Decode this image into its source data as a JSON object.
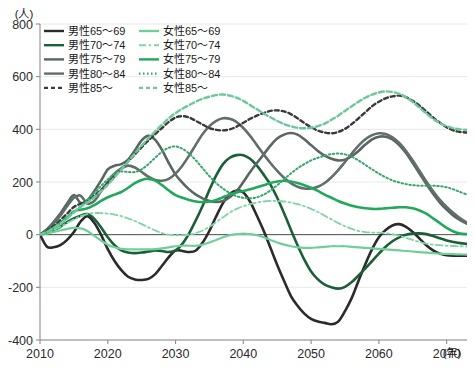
{
  "chart_data": {
    "type": "line",
    "title": "",
    "ylabel": "(人)",
    "xlabel": "(年)",
    "ylim": [
      -400,
      800
    ],
    "xlim": [
      2010,
      2073
    ],
    "yticks": [
      -400,
      -200,
      0,
      200,
      400,
      600,
      800
    ],
    "ytick_labels": [
      "-400",
      "-200",
      "0",
      "200",
      "400",
      "600",
      "800"
    ],
    "xticks": [
      2010,
      2020,
      2030,
      2040,
      2050,
      2060,
      2070
    ],
    "xtick_labels": [
      "2010",
      "2020",
      "2030",
      "2040",
      "2050",
      "2060",
      "2070"
    ],
    "grid": true,
    "legend_position": "top-left",
    "zero_line": 0,
    "x": [
      2010,
      2011,
      2012,
      2013,
      2014,
      2015,
      2016,
      2017,
      2018,
      2019,
      2020,
      2021,
      2022,
      2023,
      2024,
      2025,
      2026,
      2027,
      2028,
      2029,
      2030,
      2031,
      2032,
      2033,
      2034,
      2035,
      2036,
      2037,
      2038,
      2039,
      2040,
      2041,
      2042,
      2043,
      2044,
      2045,
      2046,
      2047,
      2048,
      2049,
      2050,
      2051,
      2052,
      2053,
      2054,
      2055,
      2056,
      2057,
      2058,
      2059,
      2060,
      2061,
      2062,
      2063,
      2064,
      2065,
      2066,
      2067,
      2068,
      2069,
      2070,
      2071,
      2072,
      2073
    ],
    "series": [
      {
        "name": "男性65〜69",
        "color": "#2b2b2b",
        "dash": "none",
        "width": 2.6,
        "values": [
          0,
          -45,
          -48,
          -40,
          -20,
          10,
          50,
          70,
          45,
          0,
          -55,
          -100,
          -135,
          -160,
          -170,
          -172,
          -168,
          -150,
          -118,
          -85,
          -60,
          -62,
          -66,
          -60,
          -30,
          15,
          70,
          120,
          155,
          168,
          160,
          125,
          72,
          15,
          -50,
          -115,
          -175,
          -232,
          -270,
          -300,
          -320,
          -330,
          -335,
          -340,
          -330,
          -290,
          -240,
          -175,
          -112,
          -55,
          -10,
          18,
          35,
          40,
          30,
          10,
          -15,
          -40,
          -60,
          -72,
          -78,
          -80,
          -80,
          -80
        ]
      },
      {
        "name": "男性70〜74",
        "color": "#1c5e38",
        "dash": "none",
        "width": 2.6,
        "values": [
          0,
          8,
          18,
          30,
          48,
          62,
          72,
          78,
          60,
          28,
          -10,
          -40,
          -60,
          -68,
          -70,
          -68,
          -64,
          -60,
          -62,
          -66,
          -60,
          -35,
          5,
          55,
          110,
          170,
          225,
          268,
          292,
          302,
          302,
          288,
          262,
          228,
          190,
          140,
          82,
          20,
          -40,
          -95,
          -140,
          -170,
          -190,
          -200,
          -205,
          -198,
          -180,
          -155,
          -128,
          -100,
          -72,
          -46,
          -25,
          -10,
          0,
          4,
          5,
          2,
          -5,
          -14,
          -22,
          -28,
          -32,
          -35
        ]
      },
      {
        "name": "男性75〜79",
        "color": "#5a6663",
        "dash": "none",
        "width": 2.6,
        "values": [
          0,
          20,
          48,
          80,
          118,
          150,
          120,
          130,
          165,
          205,
          248,
          262,
          268,
          285,
          320,
          358,
          375,
          360,
          322,
          272,
          228,
          198,
          172,
          152,
          138,
          128,
          124,
          128,
          142,
          165,
          200,
          238,
          272,
          305,
          338,
          365,
          380,
          386,
          380,
          362,
          340,
          318,
          300,
          288,
          282,
          285,
          298,
          318,
          342,
          362,
          372,
          372,
          362,
          340,
          310,
          272,
          232,
          192,
          155,
          122,
          95,
          72,
          55,
          42
        ]
      },
      {
        "name": "男性80〜84",
        "color": "#626e6b",
        "dash": "none",
        "width": 2.6,
        "values": [
          0,
          18,
          42,
          72,
          108,
          140,
          148,
          118,
          128,
          165,
          200,
          232,
          252,
          262,
          255,
          238,
          220,
          208,
          205,
          212,
          232,
          262,
          300,
          342,
          382,
          412,
          432,
          442,
          440,
          428,
          405,
          375,
          340,
          305,
          272,
          242,
          216,
          196,
          182,
          175,
          175,
          182,
          196,
          218,
          245,
          276,
          308,
          338,
          362,
          378,
          385,
          382,
          370,
          348,
          318,
          282,
          242,
          202,
          165,
          132,
          105,
          82,
          62,
          45
        ]
      },
      {
        "name": "男性85〜",
        "color": "#3a3a3a",
        "dash": "4,3",
        "width": 2.4,
        "values": [
          0,
          14,
          32,
          55,
          80,
          105,
          118,
          130,
          148,
          170,
          195,
          222,
          250,
          278,
          305,
          332,
          358,
          382,
          405,
          428,
          445,
          450,
          445,
          432,
          418,
          405,
          398,
          396,
          400,
          410,
          425,
          440,
          452,
          462,
          470,
          472,
          468,
          458,
          442,
          424,
          408,
          395,
          388,
          385,
          390,
          402,
          420,
          442,
          465,
          488,
          505,
          518,
          525,
          528,
          522,
          508,
          490,
          468,
          445,
          425,
          408,
          396,
          390,
          388
        ]
      },
      {
        "name": "女性65〜69",
        "color": "#6fcf97",
        "dash": "none",
        "width": 2.2,
        "values": [
          0,
          4,
          10,
          16,
          22,
          26,
          24,
          14,
          -4,
          -22,
          -38,
          -48,
          -54,
          -56,
          -56,
          -56,
          -56,
          -55,
          -52,
          -48,
          -44,
          -42,
          -42,
          -42,
          -38,
          -30,
          -20,
          -10,
          -2,
          2,
          4,
          2,
          -2,
          -10,
          -20,
          -30,
          -38,
          -44,
          -48,
          -50,
          -50,
          -48,
          -46,
          -44,
          -44,
          -44,
          -46,
          -48,
          -50,
          -52,
          -54,
          -56,
          -58,
          -60,
          -62,
          -64,
          -66,
          -68,
          -70,
          -72,
          -73,
          -74,
          -75,
          -76
        ]
      },
      {
        "name": "女性70〜74",
        "color": "#7ed6a3",
        "dash": "7,3,2,3",
        "width": 1.8,
        "values": [
          0,
          8,
          18,
          30,
          44,
          58,
          70,
          78,
          82,
          82,
          80,
          76,
          70,
          62,
          52,
          40,
          28,
          16,
          6,
          0,
          -2,
          -2,
          0,
          6,
          16,
          30,
          48,
          66,
          84,
          98,
          108,
          116,
          122,
          126,
          128,
          128,
          126,
          122,
          116,
          108,
          98,
          86,
          72,
          58,
          44,
          32,
          22,
          14,
          10,
          8,
          8,
          6,
          2,
          -4,
          -12,
          -20,
          -28,
          -34,
          -38,
          -40,
          -42,
          -43,
          -44,
          -45
        ]
      },
      {
        "name": "女性75〜79",
        "color": "#22a85a",
        "dash": "none",
        "width": 2.6,
        "values": [
          0,
          10,
          26,
          44,
          65,
          88,
          95,
          100,
          112,
          128,
          142,
          152,
          162,
          178,
          196,
          208,
          212,
          205,
          188,
          168,
          150,
          140,
          132,
          126,
          124,
          126,
          132,
          142,
          152,
          160,
          166,
          172,
          180,
          188,
          196,
          202,
          205,
          202,
          196,
          188,
          178,
          166,
          152,
          140,
          128,
          118,
          110,
          104,
          100,
          98,
          98,
          100,
          102,
          104,
          104,
          100,
          92,
          80,
          62,
          44,
          26,
          12,
          4,
          2
        ]
      },
      {
        "name": "女性80〜84",
        "color": "#36a86a",
        "dash": "1.5,2.5",
        "width": 2.0,
        "values": [
          0,
          10,
          24,
          42,
          62,
          85,
          108,
          132,
          158,
          185,
          210,
          232,
          240,
          238,
          238,
          248,
          268,
          292,
          315,
          330,
          335,
          326,
          308,
          282,
          252,
          222,
          196,
          175,
          158,
          146,
          140,
          138,
          142,
          152,
          168,
          188,
          210,
          232,
          252,
          268,
          282,
          292,
          300,
          306,
          308,
          305,
          296,
          282,
          265,
          248,
          232,
          218,
          206,
          198,
          192,
          188,
          186,
          186,
          186,
          184,
          180,
          172,
          162,
          152
        ]
      },
      {
        "name": "女性85〜",
        "color": "#6ec79a",
        "dash": "5,3",
        "width": 2.4,
        "values": [
          0,
          10,
          24,
          42,
          62,
          85,
          105,
          122,
          142,
          165,
          190,
          218,
          248,
          278,
          308,
          338,
          366,
          392,
          418,
          442,
          462,
          478,
          492,
          505,
          516,
          524,
          530,
          532,
          528,
          520,
          508,
          492,
          476,
          460,
          446,
          432,
          420,
          412,
          406,
          404,
          406,
          412,
          422,
          436,
          452,
          470,
          488,
          505,
          520,
          532,
          540,
          544,
          542,
          535,
          522,
          504,
          482,
          460,
          440,
          424,
          412,
          404,
          400,
          398
        ]
      }
    ]
  },
  "axis": {
    "y_unit": "(人)",
    "x_unit": "(年)"
  },
  "legend": {
    "columns": [
      {
        "items": [
          {
            "label": "男性65〜69",
            "color": "#2b2b2b",
            "style": "solid"
          },
          {
            "label": "男性70〜74",
            "color": "#1c5e38",
            "style": "solid"
          },
          {
            "label": "男性75〜79",
            "color": "#5a6663",
            "style": "solid"
          },
          {
            "label": "男性80〜84",
            "color": "#626e6b",
            "style": "solid"
          },
          {
            "label": "男性85〜",
            "color": "#3a3a3a",
            "style": "dashed"
          }
        ]
      },
      {
        "items": [
          {
            "label": "女性65〜69",
            "color": "#6fcf97",
            "style": "solid"
          },
          {
            "label": "女性70〜74",
            "color": "#7ed6a3",
            "style": "dashdot"
          },
          {
            "label": "女性75〜79",
            "color": "#22a85a",
            "style": "solid"
          },
          {
            "label": "女性80〜84",
            "color": "#36a86a",
            "style": "dotted"
          },
          {
            "label": "女性85〜",
            "color": "#6ec79a",
            "style": "dashed"
          }
        ]
      }
    ]
  },
  "style": {
    "grid_color": "#e8e8e8",
    "axis_color": "#8c8c8c",
    "zero_line_color": "#4d4d4d",
    "background": "#ffffff"
  }
}
